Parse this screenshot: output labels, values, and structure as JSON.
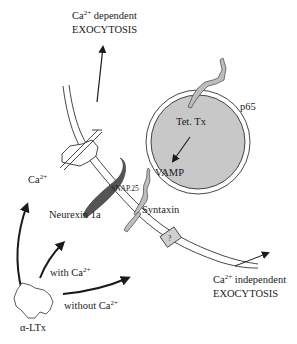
{
  "diagram": {
    "labels": {
      "ca_dependent_line1_base": "Ca",
      "ca_dependent_line1_sup": "2+",
      "ca_dependent_line1_rest": " dependent",
      "ca_dependent_line2": "EXOCYTOSIS",
      "ca_independent_line1_base": "Ca",
      "ca_independent_line1_sup": "2+",
      "ca_independent_line1_rest": " independent",
      "ca_independent_line2": "EXOCYTOSIS",
      "p65": "p65",
      "tet_tx": "Tet. Tx",
      "vamp": "VAMP",
      "snap25": "SNAP.25",
      "syntaxin": "Syntaxin",
      "neurexin": "Neurexin 1a",
      "ca_ion_base": "Ca",
      "ca_ion_sup": "2+",
      "with_ca_base": "with Ca",
      "with_ca_sup": "2+",
      "without_ca_base": "without Ca",
      "without_ca_sup": "2+",
      "alpha_ltx": "α-LTx",
      "unknown_receptor": "?"
    },
    "colors": {
      "vesicle_fill": "#c8c8c8",
      "neurexin_fill": "#555555",
      "receptor_fill": "#cfcfcf",
      "protein_fill": "#bdbdbd",
      "stroke": "#1a1a1a",
      "background": "#ffffff"
    }
  }
}
